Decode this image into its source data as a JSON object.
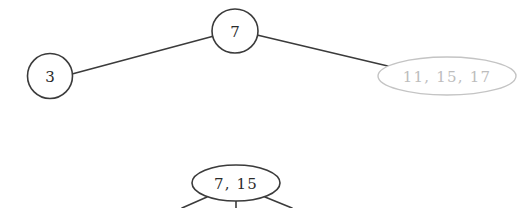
{
  "figure": {
    "background_color": "#ffffff",
    "stroke_color": "#3b3b3b",
    "faded_stroke_color": "#c4c4c4",
    "text_color": "#2b2b2b",
    "faded_text_color": "#bdbdbd"
  },
  "diagrams": [
    {
      "id": "upper-tree",
      "nodes": [
        {
          "id": "upper-root",
          "label": "7",
          "shape": "circle",
          "cx": 235,
          "cy": 31,
          "rx": 23,
          "ry": 22,
          "font_size": 15,
          "faded": false
        },
        {
          "id": "upper-left-child",
          "label": "3",
          "shape": "circle",
          "cx": 50,
          "cy": 76,
          "rx": 22.5,
          "ry": 22.5,
          "font_size": 15,
          "faded": false
        },
        {
          "id": "upper-right-child",
          "label": "11, 15, 17",
          "shape": "ellipse",
          "cx": 447,
          "cy": 76,
          "rx": 69,
          "ry": 19,
          "font_size": 15,
          "faded": true
        }
      ],
      "edges": [
        {
          "id": "edge-root-left",
          "x1": 72,
          "y1": 74,
          "x2": 214,
          "y2": 36,
          "faded": false
        },
        {
          "id": "edge-root-right",
          "x1": 257,
          "y1": 35,
          "x2": 392,
          "y2": 67,
          "faded": false
        }
      ]
    },
    {
      "id": "lower-tree",
      "nodes": [
        {
          "id": "lower-root",
          "label": "7,  15",
          "shape": "ellipse",
          "cx": 236,
          "cy": 183,
          "rx": 44,
          "ry": 18,
          "font_size": 15,
          "faded": false
        }
      ],
      "edges": [
        {
          "id": "edge-lower-left",
          "x1": 207,
          "y1": 197,
          "x2": 182,
          "y2": 208,
          "faded": false
        },
        {
          "id": "edge-lower-middle",
          "x1": 236,
          "y1": 201,
          "x2": 236,
          "y2": 208,
          "faded": false
        },
        {
          "id": "edge-lower-right",
          "x1": 265,
          "y1": 197,
          "x2": 292,
          "y2": 208,
          "faded": false
        }
      ]
    }
  ]
}
